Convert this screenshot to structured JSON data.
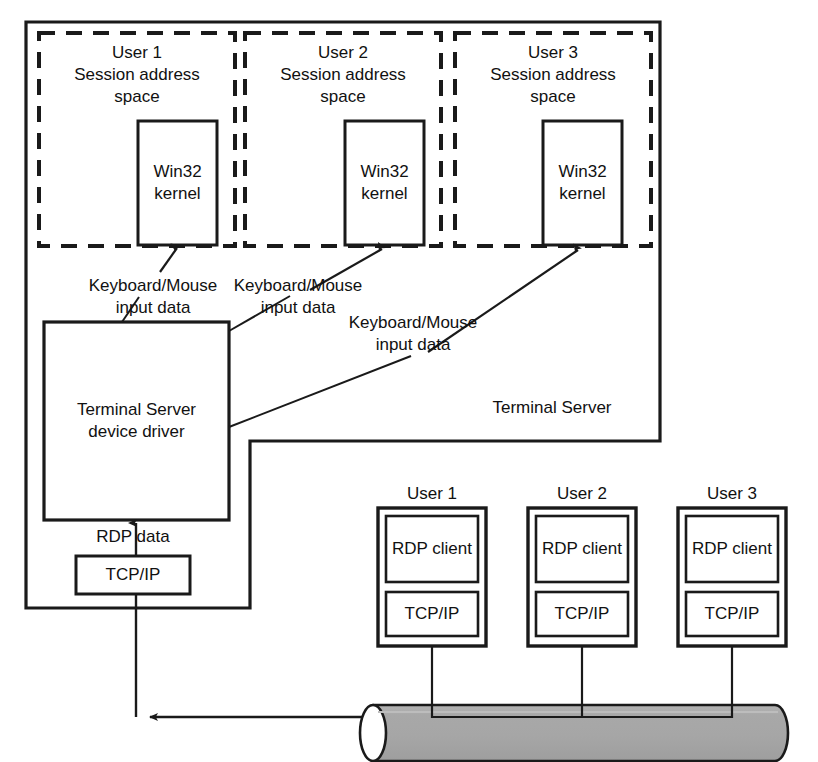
{
  "diagram": {
    "server_label": "Terminal Server",
    "colors": {
      "stroke": "#1a1a1a",
      "text": "#111111",
      "cable_fill": "#a9a9a9",
      "background": "#ffffff"
    },
    "sessions": [
      {
        "user": "User 1",
        "address_space": "Session address\nspace",
        "kernel": "Win32\nkernel"
      },
      {
        "user": "User 2",
        "address_space": "Session address\nspace",
        "kernel": "Win32\nkernel"
      },
      {
        "user": "User 3",
        "address_space": "Session address\nspace",
        "kernel": "Win32\nkernel"
      }
    ],
    "input_labels": [
      "Keyboard/Mouse\ninput data",
      "Keyboard/Mouse\ninput data",
      "Keyboard/Mouse\ninput data"
    ],
    "device_driver": "Terminal  Server\ndevice driver",
    "rdp_data_label": "RDP data",
    "server_tcpip": "TCP/IP",
    "clients": [
      {
        "user": "User 1",
        "client": "RDP client",
        "stack": "TCP/IP"
      },
      {
        "user": "User 2",
        "client": "RDP client",
        "stack": "TCP/IP"
      },
      {
        "user": "User 3",
        "client": "RDP client",
        "stack": "TCP/IP"
      }
    ]
  }
}
